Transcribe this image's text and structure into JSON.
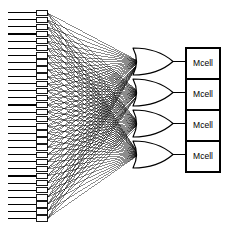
{
  "diagram": {
    "type": "fan-in-convergence-logic-diagram",
    "title": "",
    "background_color": "#ffffff",
    "line_color": "#000000",
    "canvas": {
      "width": 227,
      "height": 231
    },
    "input_column": {
      "name": "input-cells",
      "count": 30,
      "cell_label": "",
      "cell_width": 11,
      "cell_height": 5.4,
      "cell_x": 36,
      "first_cell_y": 10,
      "spacing": 7.1,
      "lead_line_start_x": 8,
      "fill_color": "#ffffff",
      "stroke_color": "#000000"
    },
    "gates": {
      "name": "or-gates",
      "count": 4,
      "shape": "or",
      "label": "",
      "x": 133,
      "width": 40,
      "height": 27,
      "first_y": 48,
      "spacing": 31,
      "fill_color": "#ffffff",
      "stroke_color": "#000000"
    },
    "outputs": {
      "name": "mcell-boxes",
      "count": 4,
      "x": 186,
      "width": 34,
      "height": 31,
      "first_y": 48,
      "labels": [
        "Mcell",
        "Mcell",
        "Mcell",
        "Mcell"
      ],
      "fill_color": "#ffffff",
      "stroke_color": "#000000"
    },
    "connections": {
      "name": "fan-in-lines",
      "description": "Every input cell connects to every OR gate input",
      "inputs_per_gate": 30,
      "total_lines": 120,
      "stroke_color": "#000000",
      "stroke_width": 0.45
    }
  }
}
